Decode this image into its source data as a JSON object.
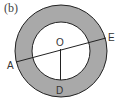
{
  "diagram": {
    "panel_label": "(b)",
    "labels": {
      "center": "O",
      "point_a": "A",
      "point_e": "E",
      "point_d": "D"
    },
    "colors": {
      "ring_fill": "#a9a9a9",
      "inner_fill": "#ffffff",
      "stroke": "#222222"
    }
  }
}
